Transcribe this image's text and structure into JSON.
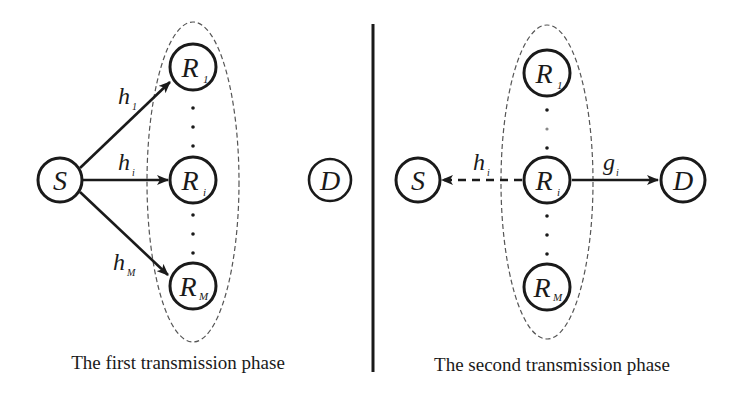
{
  "colors": {
    "ink": "#1a1a1a",
    "dash": "#555555",
    "background": "#ffffff"
  },
  "panels": [
    {
      "caption": "The first transmission phase",
      "source": {
        "label": "S",
        "sub": ""
      },
      "destination": {
        "label": "D",
        "sub": ""
      },
      "relays": [
        {
          "label": "R",
          "sub": "1"
        },
        {
          "label": "R",
          "sub": "i"
        },
        {
          "label": "R",
          "sub": "M"
        }
      ],
      "links": [
        {
          "from": "S",
          "to": "R1",
          "label": "h",
          "sub": "1",
          "style": "solid"
        },
        {
          "from": "S",
          "to": "Ri",
          "label": "h",
          "sub": "i",
          "style": "solid"
        },
        {
          "from": "S",
          "to": "RM",
          "label": "h",
          "sub": "M",
          "style": "solid"
        }
      ]
    },
    {
      "caption": "The second transmission phase",
      "source": {
        "label": "S",
        "sub": ""
      },
      "destination": {
        "label": "D",
        "sub": ""
      },
      "relays": [
        {
          "label": "R",
          "sub": "1"
        },
        {
          "label": "R",
          "sub": "i"
        },
        {
          "label": "R",
          "sub": "M"
        }
      ],
      "links": [
        {
          "from": "Ri",
          "to": "S",
          "label": "h",
          "sub": "i",
          "style": "dashed"
        },
        {
          "from": "Ri",
          "to": "D",
          "label": "g",
          "sub": "i",
          "style": "solid"
        }
      ]
    }
  ],
  "ellipsis": "⋮"
}
